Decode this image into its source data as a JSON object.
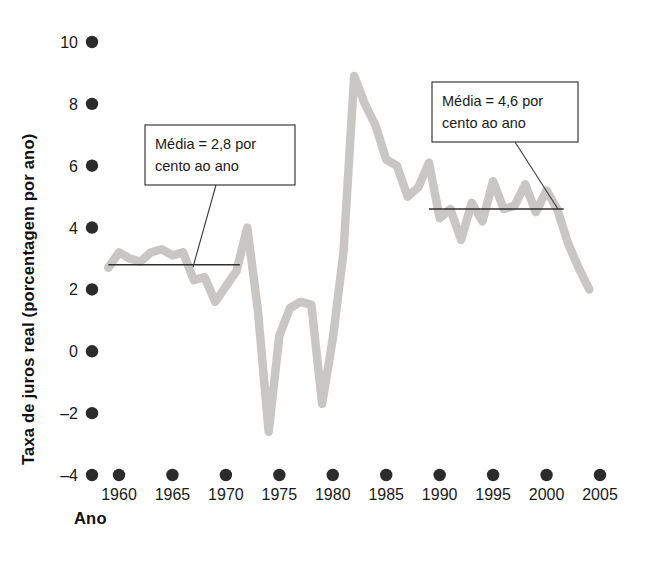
{
  "figure": {
    "background_color": "#ffffff",
    "series_color": "#c9c7c5",
    "axis_color": "#2b2b2b",
    "annotation_border_color": "#3a3a3a"
  },
  "axes": {
    "y_axis_title": "Taxa de juros real (porcentagem por ano)",
    "x_axis_title": "Ano",
    "y_ticks": [
      "10",
      "8",
      "6",
      "4",
      "2",
      "0",
      "–2",
      "–4"
    ],
    "y_tick_values": [
      10,
      8,
      6,
      4,
      2,
      0,
      -2,
      -4
    ],
    "x_ticks": [
      "1960",
      "1965",
      "1970",
      "1975",
      "1980",
      "1985",
      "1990",
      "1995",
      "2000",
      "2005"
    ],
    "x_tick_values": [
      1960,
      1965,
      1970,
      1975,
      1980,
      1985,
      1990,
      1995,
      2000,
      2005
    ]
  },
  "annotations": [
    {
      "id": "mean-early",
      "line1": "Média = 2,8 por",
      "line2": "cento ao ano",
      "value": 2.8,
      "span_start_year": 1959,
      "span_end_year": 1971.3,
      "box": {
        "x": 145,
        "y": 125,
        "width": 150,
        "height": 60
      },
      "leader": {
        "x1": 216,
        "y1": 185,
        "x2": 193,
        "y2": 267
      }
    },
    {
      "id": "mean-late",
      "line1": "Média = 4,6 por",
      "line2": "cento ao ano",
      "value": 4.6,
      "span_start_year": 1989,
      "span_end_year": 2001.6,
      "box": {
        "x": 432,
        "y": 82,
        "width": 146,
        "height": 60
      },
      "leader": {
        "x1": 515,
        "y1": 142,
        "x2": 558,
        "y2": 209
      }
    }
  ],
  "chart_data": {
    "type": "line",
    "title": "",
    "subtitle": "",
    "xlabel": "Ano",
    "ylabel": "Taxa de juros real (porcentagem por ano)",
    "xlim": [
      1958.5,
      2005.5
    ],
    "ylim": [
      -4,
      10
    ],
    "grid": false,
    "legend": null,
    "series": [
      {
        "name": "Taxa de juros real",
        "color": "#c9c7c5",
        "x": [
          1959,
          1960,
          1961,
          1962,
          1963,
          1964,
          1965,
          1966,
          1967,
          1968,
          1969,
          1970,
          1971,
          1972,
          1973,
          1974,
          1975,
          1976,
          1977,
          1978,
          1979,
          1980,
          1981,
          1982,
          1983,
          1984,
          1985,
          1986,
          1987,
          1988,
          1989,
          1990,
          1991,
          1992,
          1993,
          1994,
          1995,
          1996,
          1997,
          1998,
          1999,
          2000,
          2001,
          2002,
          2003,
          2004
        ],
        "y": [
          2.7,
          3.2,
          3.0,
          2.9,
          3.2,
          3.3,
          3.1,
          3.2,
          2.3,
          2.4,
          1.6,
          2.1,
          2.6,
          4.0,
          1.3,
          -2.6,
          0.5,
          1.4,
          1.6,
          1.5,
          -1.7,
          0.4,
          3.2,
          8.9,
          8.0,
          7.3,
          6.2,
          6.0,
          5.0,
          5.3,
          6.1,
          4.3,
          4.6,
          3.6,
          4.8,
          4.2,
          5.5,
          4.6,
          4.7,
          5.4,
          4.5,
          5.2,
          4.6,
          3.5,
          2.7,
          2.0
        ]
      }
    ],
    "reference_lines": [
      {
        "label": "Média = 2,8 por cento ao ano",
        "value": 2.8,
        "from_year": 1959,
        "to_year": 1971.3
      },
      {
        "label": "Média = 4,6 por cento ao ano",
        "value": 4.6,
        "from_year": 1989,
        "to_year": 2001.6
      }
    ]
  }
}
